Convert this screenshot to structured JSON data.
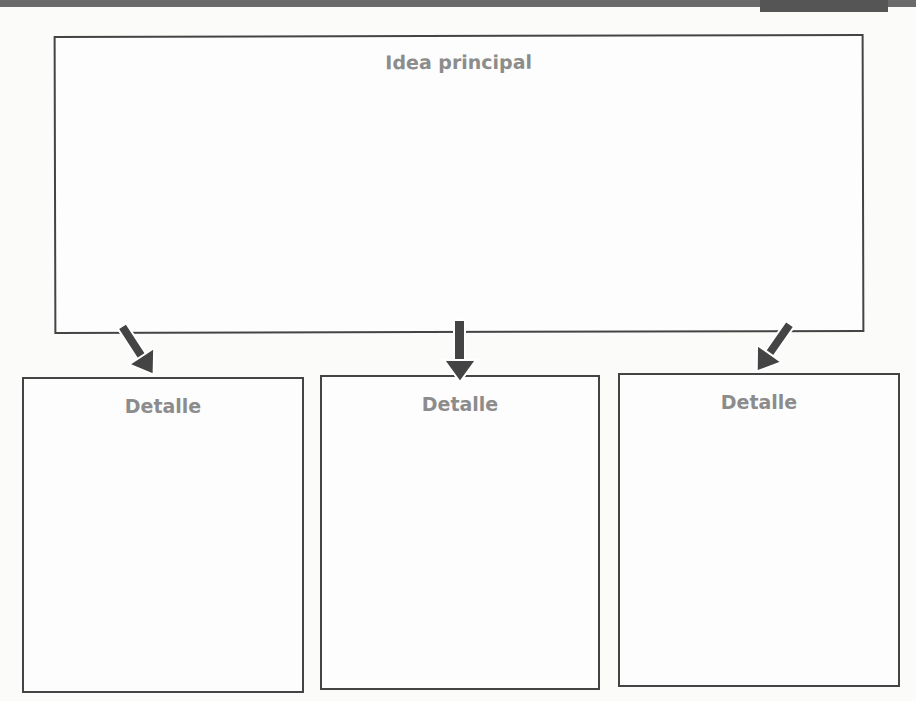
{
  "diagram": {
    "main": {
      "title": "Idea principal"
    },
    "details": [
      {
        "title": "Detalle"
      },
      {
        "title": "Detalle"
      },
      {
        "title": "Detalle"
      }
    ]
  },
  "colors": {
    "border": "#444444",
    "label": "#8c8c8c",
    "arrow": "#444444"
  }
}
